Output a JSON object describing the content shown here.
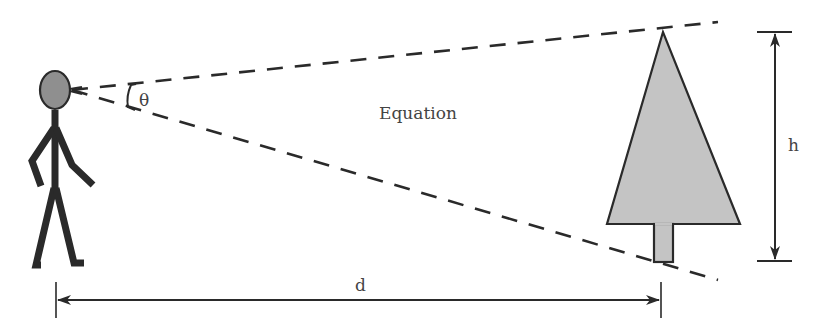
{
  "diagram": {
    "labels": {
      "angle": "θ",
      "center": "Equation",
      "height": "h",
      "distance": "d"
    },
    "colors": {
      "stroke": "#2a2a2a",
      "head_fill": "#8f8f8f",
      "tree_fill": "#c4c4c4",
      "label": "#444444",
      "background": "#ffffff"
    },
    "elements": [
      {
        "id": "person",
        "type": "stick-figure",
        "description": "Observer with grey head"
      },
      {
        "id": "sight-line-upper",
        "type": "dashed-line",
        "from": "eye",
        "to": "above tree top"
      },
      {
        "id": "sight-line-lower",
        "type": "dashed-line",
        "from": "eye",
        "to": "below tree base"
      },
      {
        "id": "angle-theta",
        "type": "angle-marker",
        "label": "θ"
      },
      {
        "id": "tree",
        "type": "triangle-with-trunk"
      },
      {
        "id": "height-dimension",
        "type": "double-arrow",
        "label": "h"
      },
      {
        "id": "distance-dimension",
        "type": "double-arrow",
        "label": "d"
      }
    ]
  }
}
